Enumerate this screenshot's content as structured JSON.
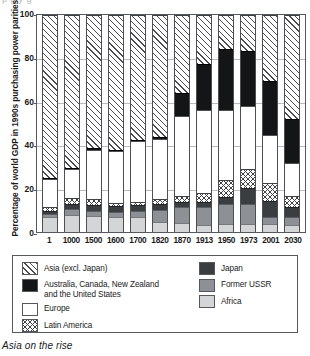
{
  "clipped_top_text": "p g           y      g",
  "caption": "Asia on the rise",
  "chart_data": {
    "type": "bar",
    "stacked": true,
    "title": "",
    "xlabel": "",
    "ylabel": "Percentage of world GDP in 1990s purchasing power parities",
    "ylim": [
      0,
      100
    ],
    "yticks": [
      0,
      20,
      40,
      60,
      80,
      100
    ],
    "grid": true,
    "legend_position": "below-plot",
    "categories": [
      "1",
      "1000",
      "1500",
      "1600",
      "1700",
      "1820",
      "1870",
      "1913",
      "1950",
      "1973",
      "2001",
      "2030"
    ],
    "series": [
      {
        "name": "Africa",
        "values": [
          7.0,
          8.0,
          7.5,
          7.0,
          7.0,
          4.5,
          4.0,
          3.0,
          3.5,
          3.5,
          3.5,
          3.0
        ]
      },
      {
        "name": "Former USSR",
        "values": [
          1.5,
          2.5,
          2.0,
          2.0,
          2.5,
          5.5,
          7.5,
          8.5,
          9.5,
          9.5,
          3.5,
          4.0
        ]
      },
      {
        "name": "Japan",
        "values": [
          1.0,
          2.5,
          3.0,
          3.0,
          3.0,
          3.0,
          2.5,
          2.5,
          3.0,
          7.5,
          7.5,
          4.5
        ]
      },
      {
        "name": "Latin America",
        "values": [
          2.0,
          2.5,
          2.5,
          1.5,
          1.5,
          2.0,
          2.5,
          4.0,
          8.0,
          8.5,
          8.0,
          5.0
        ]
      },
      {
        "name": "Europe",
        "values": [
          13.0,
          13.5,
          23.0,
          24.0,
          28.0,
          28.0,
          37.0,
          38.0,
          32.0,
          29.0,
          22.0,
          15.5
        ]
      },
      {
        "name": "Australia, Canada, New Zealand and the United States",
        "values": [
          0.5,
          0.5,
          0.5,
          0.5,
          0.5,
          1.0,
          10.5,
          21.5,
          28.5,
          25.5,
          25.0,
          20.0
        ]
      },
      {
        "name": "Asia (excl. Japan)",
        "values": [
          75.0,
          70.5,
          61.5,
          62.0,
          57.5,
          56.0,
          36.0,
          22.5,
          15.5,
          16.5,
          30.5,
          48.0
        ]
      }
    ]
  },
  "legend": {
    "left_column": [
      {
        "label": "Asia (excl. Japan)",
        "label_line2": "",
        "swatch": "diagonal-hatch",
        "color": "#ffffff"
      },
      {
        "label": "Australia, Canada, New Zealand",
        "label_line2": "and the United States",
        "swatch": "solid-black",
        "color": "#131516"
      },
      {
        "label": "Europe",
        "label_line2": "",
        "swatch": "dotted",
        "color": "#ffffff"
      },
      {
        "label": "Latin America",
        "label_line2": "",
        "swatch": "cross-hatch",
        "color": "#ffffff"
      }
    ],
    "right_column": [
      {
        "label": "Japan",
        "swatch": "solid-dark-gray",
        "color": "#3b3e41"
      },
      {
        "label": "Former USSR",
        "swatch": "solid-mid-gray",
        "color": "#8d9094"
      },
      {
        "label": "Africa",
        "swatch": "solid-light-gray",
        "color": "#d3d5d7"
      }
    ]
  }
}
